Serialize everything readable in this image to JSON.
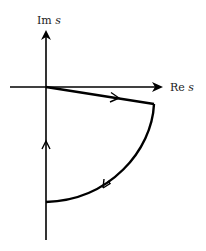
{
  "diagram": {
    "axes": {
      "imag_label": "Im",
      "imag_var": "s",
      "real_label": "Re",
      "real_var": "s"
    },
    "colors": {
      "stroke": "#000000",
      "background": "#ffffff",
      "label": "#222222"
    },
    "geometry": {
      "origin": [
        46,
        87
      ],
      "corner": [
        154,
        104
      ],
      "arc_end": [
        46,
        202
      ],
      "imag_axis_top": 30,
      "imag_axis_bottom": 240,
      "real_axis_left": 10,
      "real_axis_right": 163
    },
    "path_segments": [
      {
        "name": "ray-segment",
        "from": "origin",
        "to": "corner",
        "direction": "outward"
      },
      {
        "name": "arc-segment",
        "from": "corner",
        "to": "arc_end",
        "direction": "clockwise"
      },
      {
        "name": "imag-axis-segment",
        "from": "arc_end",
        "to": "origin",
        "direction": "upward"
      }
    ]
  }
}
